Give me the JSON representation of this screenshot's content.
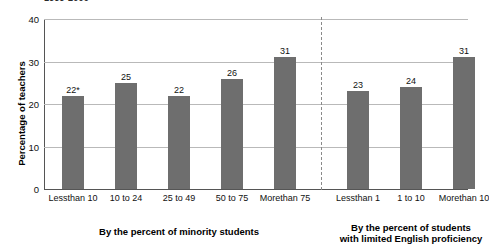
{
  "chart_data": {
    "type": "bar",
    "title": "1999-2000",
    "xlabel": "",
    "ylabel": "Percentage of teachers",
    "ylim": [
      0,
      40
    ],
    "yticks": [
      0,
      10,
      20,
      30,
      40
    ],
    "ytick_labels": [
      "0",
      "10",
      "20",
      "30",
      "40"
    ],
    "grid": "horizontal",
    "legend": "none",
    "panels": [
      {
        "caption_lines": [
          "By the percent of minority students"
        ],
        "categories": [
          "Less\nthan 10",
          "10 to 24",
          "25 to 49",
          "50 to 75",
          "More\nthan 75"
        ],
        "values": [
          22,
          25,
          22,
          26,
          31
        ],
        "value_labels": [
          "22*",
          "25",
          "22",
          "26",
          "31"
        ]
      },
      {
        "caption_lines": [
          "By the percent of students",
          "with limited English proficiency"
        ],
        "categories": [
          "Less\nthan 1",
          "1 to 10",
          "More\nthan 10"
        ],
        "values": [
          23,
          24,
          31
        ],
        "value_labels": [
          "23",
          "24",
          "31"
        ]
      }
    ],
    "annotations": [
      "* value carries a footnote asterisk"
    ],
    "colors": {
      "bar": "#6e6e6e",
      "gridline": "#b9b9b9",
      "axis": "#555555",
      "divider": "#8a8a8a",
      "text": "#111111",
      "background": "#ffffff"
    }
  },
  "title": {
    "text": "1999-2000"
  },
  "y_axis": {
    "label": "Percentage of teachers",
    "ticks": [
      {
        "value": 40,
        "label": "40"
      },
      {
        "value": 30,
        "label": "30"
      },
      {
        "value": 20,
        "label": "20"
      },
      {
        "value": 10,
        "label": "10"
      },
      {
        "value": 0,
        "label": "0"
      }
    ]
  },
  "left_panel": {
    "caption": "By the percent of minority students",
    "bars": [
      {
        "value": 22,
        "value_label": "22*",
        "cat_line1": "Less",
        "cat_line2": "than 10"
      },
      {
        "value": 25,
        "value_label": "25",
        "cat_line1": "10 to 24",
        "cat_line2": ""
      },
      {
        "value": 22,
        "value_label": "22",
        "cat_line1": "25 to 49",
        "cat_line2": ""
      },
      {
        "value": 26,
        "value_label": "26",
        "cat_line1": "50 to 75",
        "cat_line2": ""
      },
      {
        "value": 31,
        "value_label": "31",
        "cat_line1": "More",
        "cat_line2": "than 75"
      }
    ]
  },
  "right_panel": {
    "caption_line1": "By the percent of students",
    "caption_line2": "with limited English proficiency",
    "bars": [
      {
        "value": 23,
        "value_label": "23",
        "cat_line1": "Less",
        "cat_line2": "than 1"
      },
      {
        "value": 24,
        "value_label": "24",
        "cat_line1": "1 to 10",
        "cat_line2": ""
      },
      {
        "value": 31,
        "value_label": "31",
        "cat_line1": "More",
        "cat_line2": "than 10"
      }
    ]
  }
}
